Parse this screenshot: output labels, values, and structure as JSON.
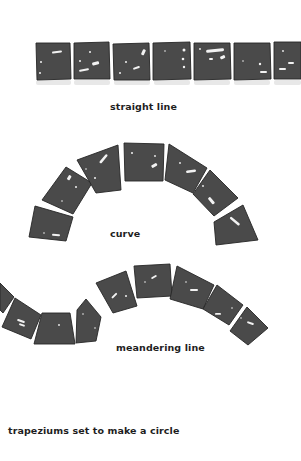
{
  "diagram": {
    "colors": {
      "background": "#ffffff",
      "tile_fill": "#4a4a4a",
      "tile_edge": "#262626",
      "highlight": "#f2f2f2",
      "caption_text": "#1e1e1e"
    },
    "sections": [
      {
        "id": "straight",
        "caption": "straight line",
        "shape": "square tiles in a row",
        "tile_count_visible": 8
      },
      {
        "id": "curve",
        "caption": "curve",
        "shape": "trapezium tiles forming an arch",
        "tile_count_visible": 7
      },
      {
        "id": "meander",
        "caption": "meandering line",
        "shape": "tiles following an S-shaped wave",
        "tile_count_visible": 9
      },
      {
        "id": "circle",
        "caption": "trapeziums set to make a circle",
        "shape": "not shown",
        "tile_count_visible": 0
      }
    ]
  }
}
